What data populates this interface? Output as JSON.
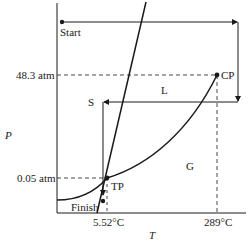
{
  "diagram": {
    "type": "phase-diagram",
    "axes": {
      "x_label": "T",
      "y_label": "P",
      "x_ticks": [
        "5.52°C",
        "289°C"
      ],
      "y_ticks": [
        "48.3 atm",
        "0.05 atm"
      ]
    },
    "regions": {
      "solid": "S",
      "liquid": "L",
      "gas": "G"
    },
    "points": {
      "start": "Start",
      "finish": "Finish",
      "triple_point": "TP",
      "critical_point": "CP"
    },
    "colors": {
      "line": "#1a1a1a",
      "background": "#ffffff"
    }
  }
}
